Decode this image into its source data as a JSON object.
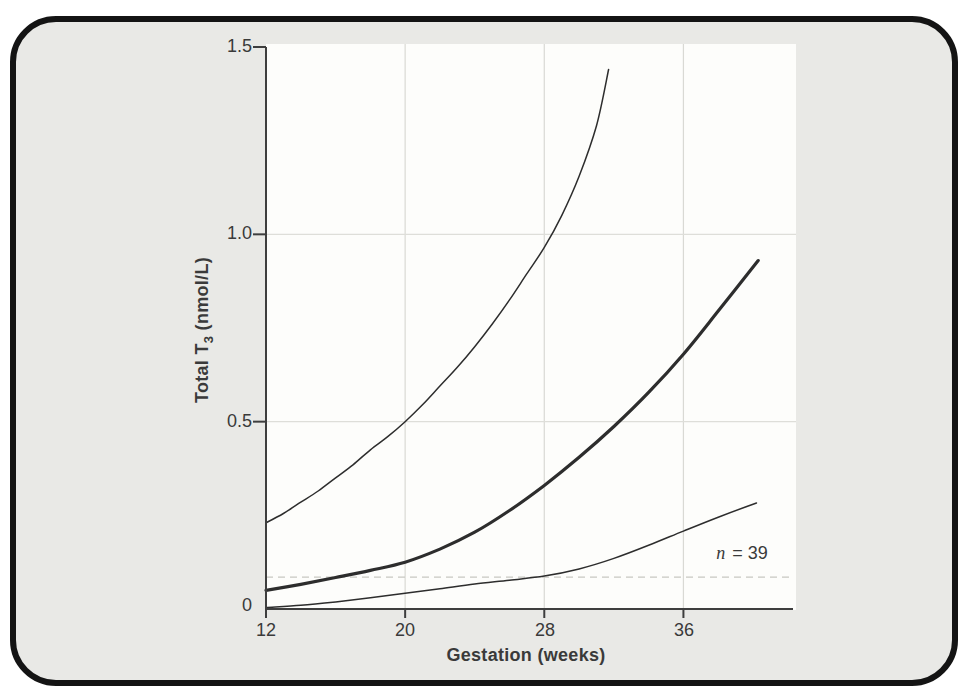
{
  "figure": {
    "card_bg": "#e9e9e6",
    "plot_bg": "#fdfdfb",
    "border_color": "#141414",
    "axis_color": "#3e3e3e",
    "text_color": "#3a3a3a",
    "line_color": "#2d2d2d",
    "vgrid_color": "#d9d9d4",
    "hgrid_color": "#deded9",
    "dash_color": "#c8c8c2"
  },
  "chart_data": {
    "type": "line",
    "title": "",
    "xlabel": "Gestation (weeks)",
    "ylabel": "Total T3 (nmol/L)",
    "ylabel_parts": {
      "prefix": "Total T",
      "sub": "3",
      "suffix": " (nmol/L)"
    },
    "annotation": {
      "var": "n",
      "rest": " = 39"
    },
    "x_ticks": [
      "12",
      "20",
      "28",
      "36"
    ],
    "x_tick_values": [
      12,
      20,
      28,
      36
    ],
    "y_ticks": [
      "0",
      "0.5",
      "1.0",
      "1.5"
    ],
    "y_tick_values": [
      0,
      0.5,
      1.0,
      1.5
    ],
    "xlim": [
      12,
      42.3
    ],
    "ylim": [
      0,
      1.5
    ],
    "x_gridlines": [
      20,
      28,
      36
    ],
    "y_gridlines": [
      0.5,
      1.0
    ],
    "grid": true,
    "legend": "none",
    "dashed_line_y": 0.085,
    "series": [
      {
        "name": "upper-centile",
        "stroke_width": 1.5,
        "points": [
          [
            12,
            0.23
          ],
          [
            13,
            0.255
          ],
          [
            14,
            0.285
          ],
          [
            15,
            0.315
          ],
          [
            16,
            0.35
          ],
          [
            17,
            0.385
          ],
          [
            18,
            0.425
          ],
          [
            19,
            0.46
          ],
          [
            20,
            0.5
          ],
          [
            21,
            0.545
          ],
          [
            22,
            0.595
          ],
          [
            23,
            0.645
          ],
          [
            24,
            0.7
          ],
          [
            25,
            0.76
          ],
          [
            26,
            0.825
          ],
          [
            27,
            0.895
          ],
          [
            28,
            0.965
          ],
          [
            29,
            1.05
          ],
          [
            30,
            1.155
          ],
          [
            31,
            1.29
          ],
          [
            31.7,
            1.44
          ]
        ]
      },
      {
        "name": "median",
        "stroke_width": 3.2,
        "points": [
          [
            12,
            0.05
          ],
          [
            14,
            0.066
          ],
          [
            16,
            0.084
          ],
          [
            18,
            0.103
          ],
          [
            20,
            0.125
          ],
          [
            22,
            0.16
          ],
          [
            24,
            0.205
          ],
          [
            26,
            0.263
          ],
          [
            28,
            0.33
          ],
          [
            30,
            0.405
          ],
          [
            32,
            0.487
          ],
          [
            34,
            0.578
          ],
          [
            36,
            0.68
          ],
          [
            38,
            0.795
          ],
          [
            40.3,
            0.93
          ]
        ]
      },
      {
        "name": "lower-centile",
        "stroke_width": 1.5,
        "points": [
          [
            12,
            0.004
          ],
          [
            14,
            0.01
          ],
          [
            16,
            0.019
          ],
          [
            18,
            0.03
          ],
          [
            20,
            0.042
          ],
          [
            22,
            0.054
          ],
          [
            24,
            0.067
          ],
          [
            26,
            0.077
          ],
          [
            28,
            0.088
          ],
          [
            30,
            0.107
          ],
          [
            32,
            0.135
          ],
          [
            34,
            0.17
          ],
          [
            36,
            0.208
          ],
          [
            38,
            0.245
          ],
          [
            40.2,
            0.283
          ]
        ]
      }
    ]
  }
}
